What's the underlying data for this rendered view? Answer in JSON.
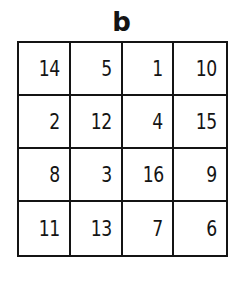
{
  "diagram": {
    "label": "b",
    "type": "magic-square-grid",
    "rows": [
      [
        "14",
        "5",
        "1",
        "10"
      ],
      [
        "2",
        "12",
        "4",
        "15"
      ],
      [
        "8",
        "3",
        "16",
        "9"
      ],
      [
        "11",
        "13",
        "7",
        "6"
      ]
    ]
  }
}
